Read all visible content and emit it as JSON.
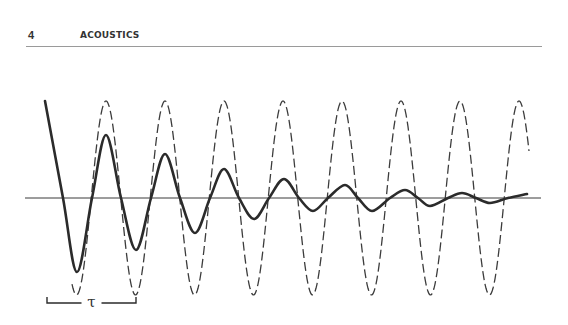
{
  "header": {
    "page_number": "4",
    "running_title": "ACOUSTICS"
  },
  "figure": {
    "tau_label": "τ",
    "colors": {
      "ink": "#2b2b2b",
      "axis": "#3a3a3a",
      "dashed": "#3c3c3c"
    }
  },
  "chart_data": {
    "type": "line",
    "title": "",
    "xlabel": "",
    "ylabel": "",
    "axis": {
      "y_px": 198,
      "x_start_px": 25,
      "x_end_px": 541
    },
    "series": [
      {
        "name": "undamped (dashed)",
        "style": "dashed",
        "period_px": 59,
        "first_peak_x_px": 106,
        "peak_y_px": 101,
        "trough_y_px": 295,
        "x_start_px": 72,
        "x_end_px": 529,
        "peaks_x_px": [
          106,
          165,
          224,
          283,
          342,
          401,
          460,
          520
        ],
        "troughs_x_px": [
          77,
          136,
          194,
          253,
          313,
          372,
          431,
          490
        ]
      },
      {
        "name": "damped (solid)",
        "style": "solid",
        "points_px": [
          [
            45,
            101
          ],
          [
            63,
            198
          ],
          [
            77,
            272
          ],
          [
            92,
            198
          ],
          [
            106,
            135
          ],
          [
            121,
            198
          ],
          [
            136,
            250
          ],
          [
            151,
            198
          ],
          [
            165,
            154
          ],
          [
            180,
            198
          ],
          [
            195,
            233
          ],
          [
            210,
            198
          ],
          [
            224,
            169
          ],
          [
            239,
            198
          ],
          [
            254,
            219
          ],
          [
            269,
            198
          ],
          [
            284,
            179
          ],
          [
            299,
            198
          ],
          [
            313,
            211
          ],
          [
            328,
            198
          ],
          [
            345,
            185
          ],
          [
            358,
            198
          ],
          [
            372,
            211
          ],
          [
            390,
            198
          ],
          [
            405,
            190
          ],
          [
            418,
            198
          ],
          [
            430,
            206
          ],
          [
            448,
            198
          ],
          [
            462,
            193
          ],
          [
            476,
            198
          ],
          [
            490,
            203
          ],
          [
            508,
            198
          ],
          [
            527,
            194
          ]
        ]
      }
    ],
    "annotations": [
      {
        "text": "τ",
        "type": "period-bracket",
        "x_from_px": 47,
        "x_to_px": 136,
        "y_px": 303
      }
    ]
  }
}
